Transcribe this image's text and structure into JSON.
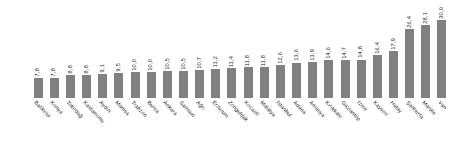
{
  "chart_data": {
    "type": "bar",
    "title": "",
    "subtitle": "",
    "xlabel": "",
    "ylabel": "",
    "ylim": [
      0,
      30.0
    ],
    "grid": false,
    "legend": null,
    "bar_color": "#808080",
    "value_label_color": "#231f20",
    "categories": [
      "Balıkesir",
      "Konya",
      "Tekirdağ",
      "Kastamonu",
      "Aydın",
      "Manisa",
      "Trabzon",
      "Bursa",
      "Ankara",
      "Samsun",
      "Ağrı",
      "Erzurum",
      "Zonguldak",
      "Kocaeli",
      "Malatya",
      "İstanbul",
      "Adana",
      "Amasya",
      "Kırıkkale",
      "Gaziantep",
      "İzmir",
      "Kayseri",
      "Hatay",
      "Şanlıurfa",
      "Mardin",
      "Van"
    ],
    "values": [
      7.8,
      7.8,
      8.8,
      8.8,
      9.1,
      9.5,
      10.0,
      10.0,
      10.5,
      10.5,
      10.7,
      11.2,
      11.4,
      11.8,
      11.8,
      12.6,
      13.6,
      13.9,
      14.6,
      14.7,
      14.8,
      16.4,
      17.9,
      26.4,
      28.1,
      30.0
    ],
    "value_labels": [
      "7,8",
      "7,8",
      "8,8",
      "8,8",
      "9,1",
      "9,5",
      "10,0",
      "10,0",
      "10,5",
      "10,5",
      "10,7",
      "11,2",
      "11,4",
      "11,8",
      "11,8",
      "12,6",
      "13,6",
      "13,9",
      "14,6",
      "14,7",
      "14,8",
      "16,4",
      "17,9",
      "26,4",
      "28,1",
      "30,0"
    ]
  }
}
